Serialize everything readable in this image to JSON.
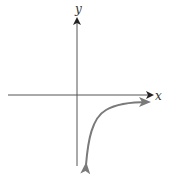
{
  "figure": {
    "type": "function-graph",
    "axes": {
      "x_label": "x",
      "y_label": "y"
    },
    "colors": {
      "axis": "#555555",
      "curve": "#7a7a7a",
      "background": "#ffffff"
    },
    "curve": {
      "quadrant": "IV",
      "end_behavior_right": "approaches x-axis from below (horizontal asymptote y = 0)",
      "end_behavior_left": "decreases without bound near y-axis (vertical asymptote x = 0)",
      "arrowheads": "both ends"
    }
  }
}
